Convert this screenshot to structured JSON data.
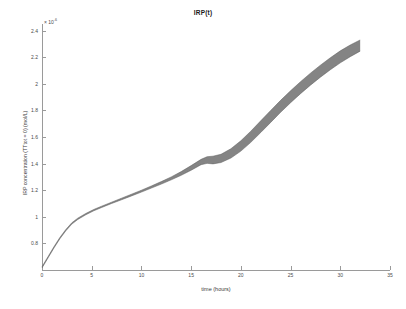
{
  "chart_data": {
    "type": "line",
    "title": "IRP(t)",
    "xlabel": "time (hours)",
    "ylabel": "IRP concentration (TTtot = 0) (mol/L)",
    "y_exponent_label": "× 10",
    "y_exponent_power": "-6",
    "xlim": [
      0,
      35
    ],
    "ylim": [
      0.6,
      2.45
    ],
    "xticks": [
      0,
      5,
      10,
      15,
      20,
      25,
      30,
      35
    ],
    "xtick_labels": [
      "0",
      "5",
      "10",
      "15",
      "20",
      "25",
      "30",
      "35"
    ],
    "yticks": [
      0.8,
      1,
      1.2,
      1.4,
      1.6,
      1.8,
      2,
      2.2,
      2.4
    ],
    "ytick_labels": [
      "0.8",
      "1",
      "1.2",
      "1.4",
      "1.6",
      "1.8",
      "2",
      "2.2",
      "2.4"
    ],
    "grid": false,
    "legend": null,
    "band_color": "#7d7d7d",
    "line_color": "#555555",
    "axis_color": "#9a9a9a",
    "series": [
      {
        "name": "IRP concentration upper envelope",
        "x": [
          0.0,
          0.6,
          1.2,
          1.8,
          2.4,
          3.0,
          3.6,
          4.4,
          5.2,
          6.0,
          7.0,
          8.0,
          9.0,
          10.0,
          11.0,
          12.0,
          13.0,
          14.0,
          15.0,
          16.0,
          16.6,
          17.2,
          18.0,
          19.0,
          20.0,
          21.0,
          22.0,
          23.0,
          24.0,
          25.0,
          26.0,
          27.0,
          28.0,
          29.0,
          30.0,
          31.0,
          32.0
        ],
        "y": [
          0.625,
          0.7,
          0.775,
          0.845,
          0.905,
          0.955,
          0.99,
          1.025,
          1.055,
          1.08,
          1.11,
          1.14,
          1.17,
          1.2,
          1.232,
          1.265,
          1.3,
          1.34,
          1.385,
          1.432,
          1.452,
          1.456,
          1.47,
          1.512,
          1.572,
          1.644,
          1.722,
          1.8,
          1.876,
          1.948,
          2.016,
          2.08,
          2.14,
          2.196,
          2.248,
          2.292,
          2.33
        ]
      },
      {
        "name": "IRP concentration lower envelope",
        "x": [
          0.0,
          0.6,
          1.2,
          1.8,
          2.4,
          3.0,
          3.6,
          4.4,
          5.2,
          6.0,
          7.0,
          8.0,
          9.0,
          10.0,
          11.0,
          12.0,
          13.0,
          14.0,
          15.0,
          16.0,
          16.6,
          17.2,
          18.0,
          19.0,
          20.0,
          21.0,
          22.0,
          23.0,
          24.0,
          25.0,
          26.0,
          27.0,
          28.0,
          29.0,
          30.0,
          31.0,
          32.0
        ],
        "y": [
          0.615,
          0.69,
          0.765,
          0.835,
          0.895,
          0.945,
          0.98,
          1.015,
          1.045,
          1.07,
          1.1,
          1.128,
          1.157,
          1.186,
          1.216,
          1.246,
          1.278,
          1.312,
          1.35,
          1.392,
          1.402,
          1.398,
          1.408,
          1.442,
          1.494,
          1.56,
          1.634,
          1.71,
          1.786,
          1.858,
          1.926,
          1.99,
          2.05,
          2.106,
          2.158,
          2.204,
          2.246
        ]
      }
    ],
    "annotations": [
      {
        "text": "band widens after t ≈ 16 h",
        "x": 16.5,
        "y": 1.43
      }
    ]
  }
}
